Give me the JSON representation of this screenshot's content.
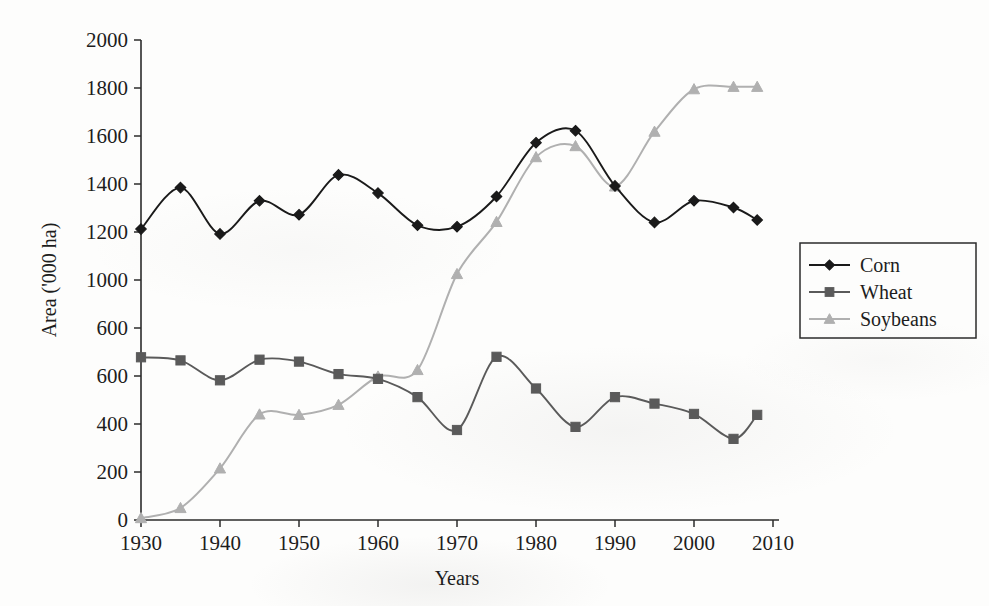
{
  "chart_data": {
    "type": "line",
    "title": "",
    "xlabel": "Years",
    "ylabel": "Area ('000 ha)",
    "xlim": [
      1930,
      2010
    ],
    "ylim": [
      0,
      2000
    ],
    "grid": false,
    "legend_position": "right",
    "x_tick_labels": [
      "1930",
      "1940",
      "1950",
      "1960",
      "1970",
      "1980",
      "1990",
      "2000",
      "2010"
    ],
    "x_tick_values": [
      1930,
      1940,
      1950,
      1960,
      1970,
      1980,
      1990,
      2000,
      2010
    ],
    "y_tick_labels": [
      "2000",
      "1800",
      "1600",
      "1400",
      "1200",
      "1000",
      "600",
      "600",
      "400",
      "200",
      "0"
    ],
    "y_tick_values": [
      2000,
      1800,
      1600,
      1400,
      1200,
      1000,
      800,
      600,
      400,
      200,
      0
    ],
    "y_tick_label_note": "As printed in the scan the 800 tick is rendered '600'; labels reproduced verbatim.",
    "x": [
      1930,
      1935,
      1940,
      1945,
      1950,
      1955,
      1960,
      1965,
      1970,
      1975,
      1980,
      1985,
      1990,
      1995,
      2000,
      2005,
      2008
    ],
    "series": [
      {
        "name": "Corn",
        "color": "#1a1a1a",
        "marker": "diamond",
        "values": [
          1212,
          1385,
          1192,
          1330,
          1272,
          1438,
          1362,
          1228,
          1222,
          1348,
          1572,
          1622,
          1392,
          1240,
          1330,
          1302,
          1250
        ]
      },
      {
        "name": "Wheat",
        "color": "#5a5a5a",
        "marker": "square",
        "values": [
          678,
          665,
          582,
          668,
          660,
          608,
          588,
          512,
          375,
          680,
          548,
          388,
          512,
          485,
          442,
          338,
          438
        ]
      },
      {
        "name": "Soybeans",
        "color": "#b0b0b0",
        "marker": "triangle",
        "values": [
          8,
          50,
          215,
          440,
          438,
          480,
          598,
          625,
          1025,
          1242,
          1512,
          1558,
          1390,
          1618,
          1795,
          1805,
          1805
        ]
      }
    ]
  },
  "legend": {
    "entries": [
      {
        "label": "Corn"
      },
      {
        "label": "Wheat"
      },
      {
        "label": "Soybeans"
      }
    ]
  }
}
